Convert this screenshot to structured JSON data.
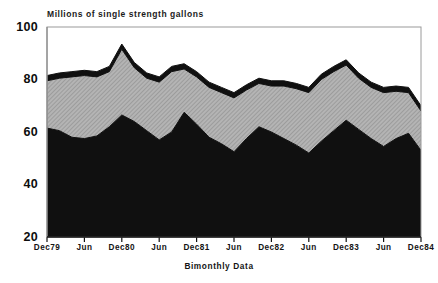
{
  "chart_data": {
    "type": "area",
    "stacked": true,
    "title": "Millions of single strength gallons",
    "xlabel": "Bimonthly Data",
    "ylabel": "",
    "ylim": [
      20,
      100
    ],
    "yticks": [
      20,
      40,
      60,
      80,
      100
    ],
    "ytick_labels": [
      "20",
      "40",
      "60",
      "80",
      "100"
    ],
    "grid": false,
    "legend": null,
    "x": [
      "Dec79",
      "Feb80",
      "Apr80",
      "Jun80",
      "Aug80",
      "Oct80",
      "Dec80",
      "Feb81",
      "Apr81",
      "Jun81",
      "Aug81",
      "Oct81",
      "Dec81",
      "Feb82",
      "Apr82",
      "Jun82",
      "Aug82",
      "Oct82",
      "Dec82",
      "Feb83",
      "Apr83",
      "Jun83",
      "Aug83",
      "Oct83",
      "Dec83",
      "Feb84",
      "Apr84",
      "Jun84",
      "Aug84",
      "Oct84",
      "Dec84"
    ],
    "xtick_positions": [
      0,
      3,
      6,
      9,
      12,
      15,
      18,
      21,
      24,
      27,
      30
    ],
    "xtick_labels": [
      "Dec79",
      "Jun",
      "Dec80",
      "Jun",
      "Dec81",
      "Jun",
      "Dec82",
      "Jun",
      "Dec83",
      "Jun",
      "Dec84"
    ],
    "series": [
      {
        "name": "bottom-band",
        "color": "#101010",
        "pattern": "solid-dark",
        "values": [
          61.5,
          60.5,
          58.0,
          57.5,
          58.5,
          62.0,
          66.5,
          64.0,
          60.5,
          57.0,
          60.0,
          67.5,
          63.0,
          58.0,
          55.5,
          52.5,
          57.5,
          62.0,
          60.0,
          57.5,
          55.0,
          52.0,
          56.5,
          60.5,
          64.5,
          61.0,
          57.5,
          54.5,
          57.5,
          59.5,
          53.0
        ]
      },
      {
        "name": "middle-band",
        "color": "#a8a8a8",
        "pattern": "hatched-gray",
        "values": [
          18.0,
          20.0,
          23.0,
          24.0,
          22.5,
          21.0,
          25.0,
          20.5,
          20.0,
          22.0,
          23.0,
          16.5,
          18.0,
          19.0,
          19.5,
          20.5,
          18.5,
          16.5,
          17.5,
          20.0,
          21.5,
          23.0,
          23.5,
          22.5,
          21.0,
          19.5,
          19.5,
          20.5,
          18.0,
          15.5,
          15.0
        ]
      },
      {
        "name": "top-band",
        "color": "#101010",
        "pattern": "solid-dark",
        "values": [
          2.0,
          2.0,
          2.0,
          2.0,
          2.0,
          2.0,
          2.0,
          2.0,
          2.0,
          2.0,
          2.0,
          2.0,
          2.0,
          2.0,
          2.0,
          2.0,
          2.0,
          2.0,
          2.0,
          2.0,
          2.0,
          2.0,
          2.0,
          2.0,
          2.0,
          2.0,
          2.0,
          2.0,
          2.0,
          2.0,
          2.0
        ]
      }
    ],
    "cumulative_top": [
      81.5,
      82.5,
      83.0,
      83.5,
      83.0,
      85.0,
      93.5,
      86.5,
      82.5,
      81.0,
      85.0,
      86.0,
      83.0,
      79.0,
      77.0,
      75.0,
      78.0,
      80.5,
      79.5,
      79.5,
      78.5,
      77.0,
      82.0,
      85.0,
      87.5,
      82.5,
      79.0,
      77.0,
      77.5,
      77.0,
      70.0
    ],
    "colors": {
      "axis": "#000000",
      "band_dark": "#101010",
      "band_gray": "#a8a8a8",
      "background": "#ffffff"
    }
  },
  "axes": {
    "y_labels": [
      "100",
      "80",
      "60",
      "40",
      "20"
    ],
    "x_labels": [
      "Dec79",
      "Jun",
      "Dec80",
      "Jun",
      "Dec81",
      "Jun",
      "Dec82",
      "Jun",
      "Dec83",
      "Jun",
      "Dec84"
    ]
  }
}
